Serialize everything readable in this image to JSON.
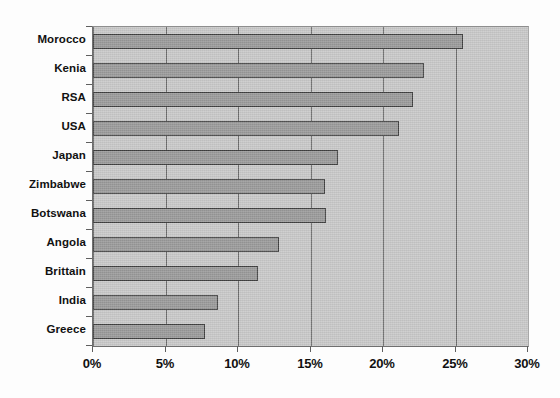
{
  "chart_data": {
    "type": "bar",
    "orientation": "horizontal",
    "title": "",
    "subtitle": "",
    "xlabel": "",
    "ylabel": "",
    "categories": [
      "Morocco",
      "Kenia",
      "RSA",
      "USA",
      "Japan",
      "Zimbabwe",
      "Botswana",
      "Angola",
      "Brittain",
      "India",
      "Greece"
    ],
    "values": [
      25.5,
      22.8,
      22.1,
      21.1,
      16.9,
      16.0,
      16.1,
      12.8,
      11.4,
      8.6,
      7.7
    ],
    "value_unit": "%",
    "xlim": [
      0,
      30
    ],
    "xticks": [
      0,
      5,
      10,
      15,
      20,
      25,
      30
    ],
    "xtick_labels": [
      "0%",
      "5%",
      "10%",
      "15%",
      "20%",
      "25%",
      "30%"
    ],
    "grid": "vertical",
    "legend": null,
    "legend_position": "none",
    "series": [
      {
        "name": "value",
        "values": [
          25.5,
          22.8,
          22.1,
          21.1,
          16.9,
          16.0,
          16.1,
          12.8,
          11.4,
          8.6,
          7.7
        ]
      }
    ]
  },
  "colors": {
    "plot_background": "#c9c9c9",
    "bar_fill": "#9a9a9a",
    "bar_border": "#404040",
    "gridline": "#6b6b6b",
    "axis": "#5f5f5f",
    "text": "#111111",
    "page_background": "#fdfdfd"
  }
}
